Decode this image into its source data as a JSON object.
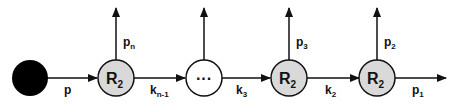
{
  "diagram": {
    "type": "reaction-chain",
    "colors": {
      "source_fill": "#000000",
      "node_fill": "#d9d9d9",
      "ellipsis_fill": "#ffffff",
      "stroke": "#111111"
    },
    "nodes": [
      {
        "id": "source",
        "label": "",
        "fill": "black"
      },
      {
        "id": "r_n",
        "label": "R",
        "sub": "2"
      },
      {
        "id": "ellipsis",
        "label": "···"
      },
      {
        "id": "r_3",
        "label": "R",
        "sub": "2"
      },
      {
        "id": "r_2",
        "label": "R",
        "sub": "2"
      }
    ],
    "edges": {
      "p": {
        "label": "p",
        "sub": ""
      },
      "k_n_1": {
        "label": "k",
        "sub": "n-1"
      },
      "k_3": {
        "label": "k",
        "sub": "3"
      },
      "k_2": {
        "label": "k",
        "sub": "2"
      },
      "p_1": {
        "label": "p",
        "sub": "1"
      }
    },
    "outputs": {
      "p_n": {
        "label": "p",
        "sub": "n"
      },
      "ellipsis_out": {
        "label": "",
        "sub": ""
      },
      "p_3": {
        "label": "p",
        "sub": "3"
      },
      "p_2": {
        "label": "p",
        "sub": "2"
      }
    }
  }
}
